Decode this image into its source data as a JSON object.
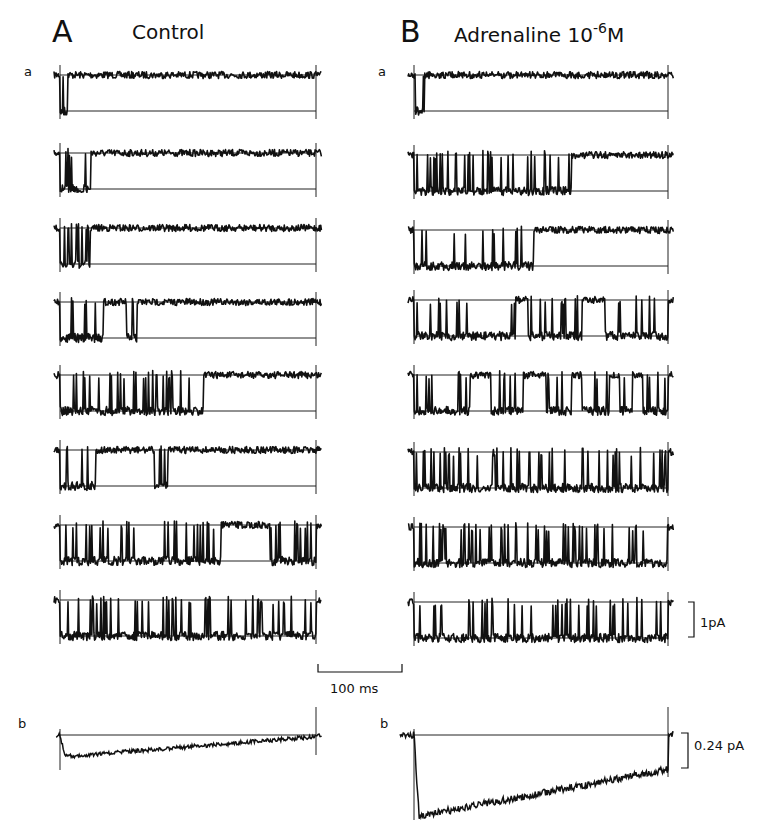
{
  "figure": {
    "panels": [
      {
        "letter": "A",
        "title": "Control",
        "title_sup": "",
        "title_suffix": ""
      },
      {
        "letter": "B",
        "title": "Adrenaline 10",
        "title_sup": "-6",
        "title_suffix": "M"
      }
    ],
    "row_labels": {
      "a": "a",
      "b": "b"
    },
    "scale_bars": {
      "time": "100 ms",
      "current_a": "1pA",
      "current_b": "0.24 pA"
    }
  },
  "chart_data": {
    "type": "line",
    "xlabel": "time",
    "ylabel": "current",
    "scale": {
      "time_bar_ms": 100,
      "current_bar_a_pA": 1,
      "current_bar_b_pA": 0.24
    },
    "panels": [
      {
        "name": "A Control",
        "a_sweeps_open_fraction_intervals": [
          [
            [
              0.0,
              0.03
            ]
          ],
          [
            [
              0.0,
              0.12
            ]
          ],
          [
            [
              0.0,
              0.12
            ]
          ],
          [
            [
              0.0,
              0.17
            ],
            [
              0.26,
              0.3
            ]
          ],
          [
            [
              0.0,
              0.56
            ]
          ],
          [
            [
              0.0,
              0.14
            ],
            [
              0.37,
              0.42
            ]
          ],
          [
            [
              0.0,
              0.63
            ],
            [
              0.82,
              1.0
            ]
          ],
          [
            [
              0.0,
              1.0
            ]
          ]
        ],
        "b_ensemble_average": {
          "peak_fraction_of_bar": 0.55,
          "decay": "slow, returns near baseline by end"
        }
      },
      {
        "name": "B Adrenaline 10^-6 M",
        "a_sweeps_open_fraction_intervals": [
          [
            [
              0.0,
              0.04
            ]
          ],
          [
            [
              0.0,
              0.62
            ]
          ],
          [
            [
              0.0,
              0.47
            ]
          ],
          [
            [
              0.0,
              0.4
            ],
            [
              0.45,
              0.66
            ],
            [
              0.75,
              1.0
            ]
          ],
          [
            [
              0.0,
              0.22
            ],
            [
              0.3,
              0.43
            ],
            [
              0.52,
              0.62
            ],
            [
              0.66,
              0.77
            ],
            [
              0.81,
              0.86
            ],
            [
              0.9,
              1.0
            ]
          ],
          [
            [
              0.0,
              1.0
            ]
          ],
          [
            [
              0.0,
              1.0
            ]
          ],
          [
            [
              0.0,
              1.0
            ]
          ]
        ],
        "b_ensemble_average": {
          "peak_fraction_of_bar": 2.4,
          "decay": "slow linear-like recovery to ~1.2x bar at end"
        }
      }
    ]
  }
}
